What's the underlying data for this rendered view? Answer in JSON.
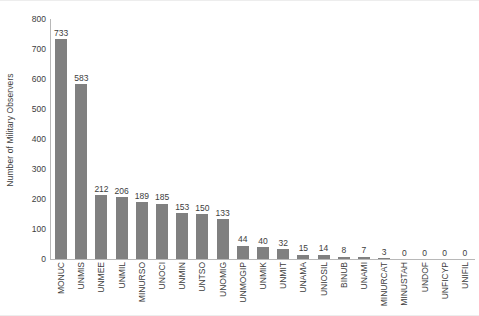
{
  "chart_data": {
    "type": "bar",
    "title": "",
    "subtitle": "",
    "xlabel": "",
    "ylabel": "Number of Military Observers",
    "ylim": [
      0,
      800
    ],
    "ytick_values": [
      0,
      100,
      200,
      300,
      400,
      500,
      600,
      700,
      800
    ],
    "ytick_labels": [
      "0",
      "100",
      "200",
      "300",
      "400",
      "500",
      "600",
      "700",
      "800"
    ],
    "grid": false,
    "legend": null,
    "bar_color": "#808080",
    "axis_color": "#b8b8b8",
    "text_color": "#3d3d3d",
    "background": "#ffffff",
    "show_value_labels": true,
    "categories": [
      "MONUC",
      "UNMIS",
      "UNMEE",
      "UNMIL",
      "MINURSO",
      "UNOCI",
      "UNMIN",
      "UNTSO",
      "UNOMIG",
      "UNMOGIP",
      "UNMIK",
      "UNMIT",
      "UNAMA",
      "UNIOSIL",
      "BINUB",
      "UNAMI",
      "MINURCAT",
      "MINUSTAH",
      "UNDOF",
      "UNFICYP",
      "UNIFIL"
    ],
    "values": [
      733,
      583,
      212,
      206,
      189,
      185,
      153,
      150,
      133,
      44,
      40,
      32,
      15,
      14,
      8,
      7,
      3,
      0,
      0,
      0,
      0
    ],
    "value_labels": [
      "733",
      "583",
      "212",
      "206",
      "189",
      "185",
      "153",
      "150",
      "133",
      "44",
      "40",
      "32",
      "15",
      "14",
      "8",
      "7",
      "3",
      "0",
      "0",
      "0",
      "0"
    ]
  }
}
